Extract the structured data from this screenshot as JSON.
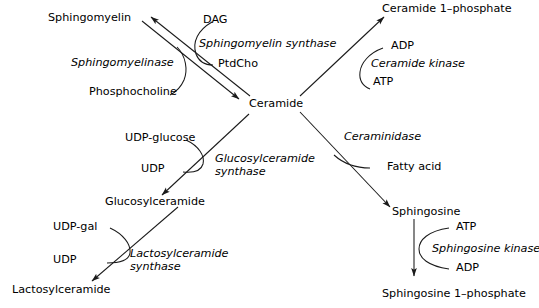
{
  "diagram": {
    "background_color": "#ffffff",
    "stroke_color": "#1a1a1a",
    "text_color": "#000000"
  },
  "metabolites": {
    "sphingomyelin": "Sphingomyelin",
    "ceramide": "Ceramide",
    "ceramide_1_phosphate": "Ceramide 1–phosphate",
    "glucosylceramide": "Glucosylceramide",
    "lactosylceramide": "Lactosylceramide",
    "sphingosine": "Sphingosine",
    "sphingosine_1_phosphate": "Sphingosine 1–phosphate"
  },
  "enzymes": {
    "sphingomyelin_synthase": "Sphingomyelin synthase",
    "sphingomyelinase": "Sphingomyelinase",
    "ceramide_kinase": "Ceramide kinase",
    "ceraminidase": "Ceraminidase",
    "glucosylceramide_synthase_line1": "Glucosylceramide",
    "glucosylceramide_synthase_line2": "synthase",
    "lactosylceramide_synthase_line1": "Lactosylceramide",
    "lactosylceramide_synthase_line2": "synthase",
    "sphingosine_kinase": "Sphingosine kinase"
  },
  "cofactors": {
    "dag": "DAG",
    "ptdcho": "PtdCho",
    "phosphocholine": "Phosphocholine",
    "adp_ceramide_kinase": "ADP",
    "atp_ceramide_kinase": "ATP",
    "fatty_acid": "Fatty acid",
    "udp_glucose": "UDP-glucose",
    "udp_glucosyl": "UDP",
    "udp_gal": "UDP-gal",
    "udp_lactosyl": "UDP",
    "atp_sphingosine_kinase": "ATP",
    "adp_sphingosine_kinase": "ADP"
  }
}
